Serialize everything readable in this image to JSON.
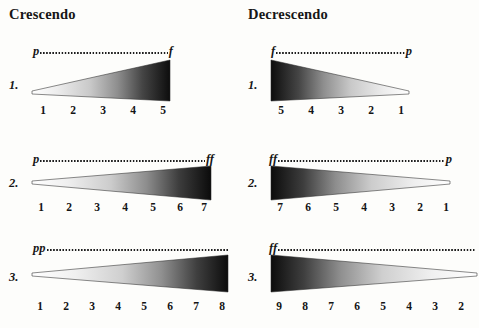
{
  "headers": {
    "left": "Crescendo",
    "right": "Decrescendo"
  },
  "columns": [
    {
      "name": "crescendo",
      "rows": [
        {
          "index_label": "1.",
          "start_mark": "p",
          "end_mark": "f",
          "direction": "crescendo",
          "scale": [
            "1",
            "2",
            "3",
            "4",
            "5"
          ]
        },
        {
          "index_label": "2.",
          "start_mark": "p",
          "end_mark": "ff",
          "direction": "crescendo",
          "scale": [
            "1",
            "2",
            "3",
            "4",
            "5",
            "6",
            "7"
          ]
        },
        {
          "index_label": "3.",
          "start_mark": "pp",
          "end_mark": "",
          "direction": "crescendo",
          "scale": [
            "1",
            "2",
            "3",
            "4",
            "5",
            "6",
            "7",
            "8"
          ]
        }
      ]
    },
    {
      "name": "decrescendo",
      "rows": [
        {
          "index_label": "1.",
          "start_mark": "f",
          "end_mark": "p",
          "direction": "decrescendo",
          "scale": [
            "5",
            "4",
            "3",
            "2",
            "1"
          ]
        },
        {
          "index_label": "2.",
          "start_mark": "ff",
          "end_mark": "p",
          "direction": "decrescendo",
          "scale": [
            "7",
            "6",
            "5",
            "4",
            "3",
            "2",
            "1"
          ]
        },
        {
          "index_label": "3.",
          "start_mark": "ff",
          "end_mark": "",
          "direction": "decrescendo",
          "scale": [
            "9",
            "8",
            "7",
            "6",
            "5",
            "4",
            "3",
            "2"
          ]
        }
      ]
    }
  ],
  "colors": {
    "background": "#fdfdfb",
    "ink": "#161616",
    "wedge_dark": "#101010",
    "wedge_light": "#f2f2f2"
  }
}
